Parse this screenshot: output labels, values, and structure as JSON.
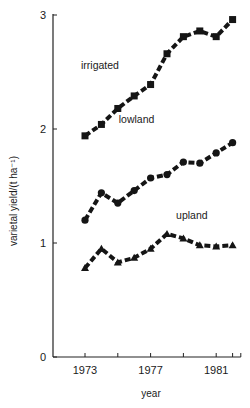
{
  "chart_data": {
    "type": "line",
    "title": "",
    "xlabel": "year",
    "ylabel": "varietal yield/(t ha⁻¹)",
    "xlim": [
      1972,
      1982.5
    ],
    "ylim": [
      0,
      3
    ],
    "x_ticks": [
      1973,
      1974,
      1975,
      1976,
      1977,
      1978,
      1979,
      1980,
      1981,
      1982
    ],
    "x_tick_labels": [
      "1973",
      "1977",
      "1981"
    ],
    "x_tick_label_values": [
      1973,
      1977,
      1981
    ],
    "y_ticks": [
      0,
      1,
      2,
      3
    ],
    "y_tick_labels": [
      "0",
      "1",
      "2",
      "3"
    ],
    "grid": false,
    "legend": "inline labels",
    "x": [
      1973,
      1974,
      1975,
      1976,
      1977,
      1978,
      1979,
      1980,
      1981,
      1982
    ],
    "series": [
      {
        "name": "irrigated",
        "marker": "square",
        "values": [
          1.94,
          2.04,
          2.18,
          2.29,
          2.39,
          2.66,
          2.81,
          2.86,
          2.81,
          2.96
        ],
        "label_pos": [
          1973,
          2.53
        ]
      },
      {
        "name": "lowland",
        "marker": "circle",
        "values": [
          1.2,
          1.44,
          1.35,
          1.46,
          1.57,
          1.6,
          1.71,
          1.7,
          1.79,
          1.88
        ],
        "label_pos": [
          1975.3,
          2.05
        ]
      },
      {
        "name": "upland",
        "marker": "triangle",
        "values": [
          0.78,
          0.95,
          0.83,
          0.87,
          0.95,
          1.08,
          1.04,
          0.98,
          0.97,
          0.98
        ],
        "label_pos": [
          1978.8,
          1.21
        ]
      }
    ]
  }
}
